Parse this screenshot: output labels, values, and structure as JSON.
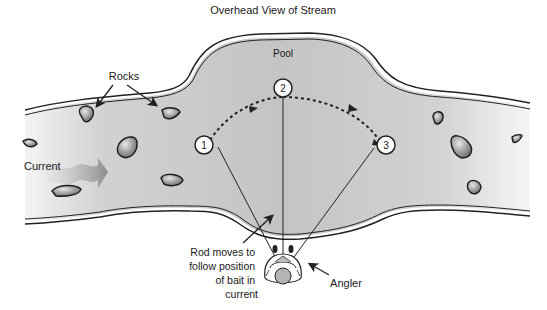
{
  "title": "Overhead View of Stream",
  "labels": {
    "pool": "Pool",
    "rocks": "Rocks",
    "current": "Current",
    "angler": "Angler",
    "rod_note": [
      "Rod moves to",
      "follow position",
      "of bait in",
      "current"
    ]
  },
  "positions": [
    {
      "number": "1"
    },
    {
      "number": "2"
    },
    {
      "number": "3"
    }
  ],
  "colors": {
    "water": "#c9c9c9",
    "water_light": "#e6e6e6",
    "bank_line": "#222222",
    "rock": "#8f8f8f",
    "current_arrow": "#9a9a9a"
  }
}
